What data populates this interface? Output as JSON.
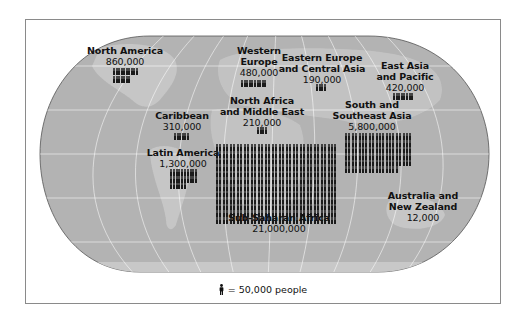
{
  "chart_data": {
    "type": "pictogram-map",
    "title": "",
    "unit_icon": "person-icon",
    "unit_value": 50000,
    "legend": "= 50,000 people",
    "regions": [
      {
        "name": "North America",
        "value": 860000,
        "icons": 17
      },
      {
        "name": "Western Europe",
        "value": 480000,
        "icons": 10
      },
      {
        "name": "Eastern Europe and Central Asia",
        "value": 190000,
        "icons": 4
      },
      {
        "name": "East Asia and Pacific",
        "value": 420000,
        "icons": 8
      },
      {
        "name": "Caribbean",
        "value": 310000,
        "icons": 6
      },
      {
        "name": "North Africa and Middle East",
        "value": 210000,
        "icons": 4
      },
      {
        "name": "South and Southeast Asia",
        "value": 5800000,
        "icons": 116
      },
      {
        "name": "Latin America",
        "value": 1300000,
        "icons": 26
      },
      {
        "name": "Sub-Saharan Africa",
        "value": 21000000,
        "icons": 420
      },
      {
        "name": "Australia and New Zealand",
        "value": 12000,
        "icons": 0
      }
    ]
  },
  "map": {
    "background": "#b4b4b4",
    "land": "#c8c8c8",
    "gridline": "#ffffff",
    "outline": "#5a5a5a"
  },
  "labels": {
    "north_america": {
      "name": "North America",
      "value": "860,000"
    },
    "western_europe": {
      "name_1": "Western",
      "name_2": "Europe",
      "value": "480,000"
    },
    "eastern_europe": {
      "name_1": "Eastern Europe",
      "name_2": "and Central Asia",
      "value": "190,000"
    },
    "east_asia": {
      "name_1": "East Asia",
      "name_2": "and Pacific",
      "value": "420,000"
    },
    "caribbean": {
      "name": "Caribbean",
      "value": "310,000"
    },
    "north_africa": {
      "name_1": "North Africa",
      "name_2": "and Middle East",
      "value": "210,000"
    },
    "south_asia": {
      "name_1": "South and",
      "name_2": "Southeast Asia",
      "value": "5,800,000"
    },
    "latin_america": {
      "name": "Latin America",
      "value": "1,300,000"
    },
    "sub_saharan": {
      "name": "Sub-Saharan Africa",
      "value": "21,000,000"
    },
    "australia": {
      "name_1": "Australia and",
      "name_2": "New Zealand",
      "value": "12,000"
    }
  },
  "legend": {
    "text": "= 50,000 people"
  }
}
